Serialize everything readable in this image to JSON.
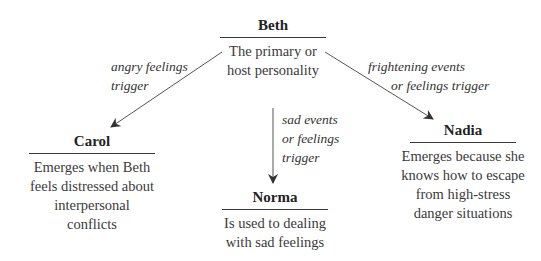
{
  "diagram": {
    "type": "tree",
    "root": {
      "name": "Beth",
      "description_lines": [
        "The primary or",
        "host personality"
      ]
    },
    "children": [
      {
        "name": "Carol",
        "description_lines": [
          "Emerges when Beth",
          "feels distressed about",
          "interpersonal conflicts"
        ],
        "edge_label_lines": [
          "angry feelings",
          "trigger"
        ]
      },
      {
        "name": "Norma",
        "description_lines": [
          "Is used to dealing",
          "with sad feelings"
        ],
        "edge_label_lines": [
          "sad events",
          "or feelings",
          "trigger"
        ]
      },
      {
        "name": "Nadia",
        "description_lines": [
          "Emerges because she",
          "knows how to escape",
          "from high-stress",
          "danger situations"
        ],
        "edge_label_lines": [
          "frightening events",
          "or feelings trigger"
        ]
      }
    ]
  }
}
